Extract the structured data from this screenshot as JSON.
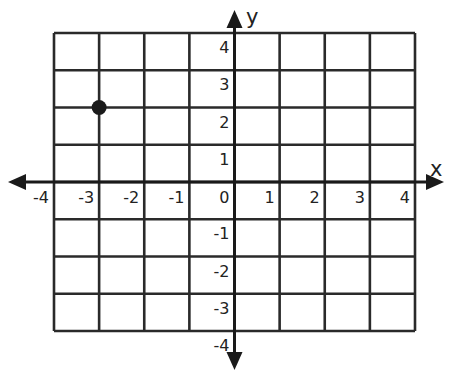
{
  "chart_data": {
    "type": "scatter",
    "title": "",
    "xlabel": "x",
    "ylabel": "y",
    "xlim": [
      -4,
      4
    ],
    "ylim": [
      -4,
      4
    ],
    "grid": true,
    "x_ticks": [
      "-4",
      "-3",
      "-2",
      "-1",
      "0",
      "1",
      "2",
      "3",
      "4"
    ],
    "y_ticks": [
      "4",
      "3",
      "2",
      "1",
      "-1",
      "-2",
      "-3",
      "-4"
    ],
    "points": [
      {
        "x": -3,
        "y": 2
      }
    ],
    "colors": {
      "grid": "#2a2a2a",
      "axis": "#1a1a1a",
      "point": "#1a1a1a"
    }
  }
}
